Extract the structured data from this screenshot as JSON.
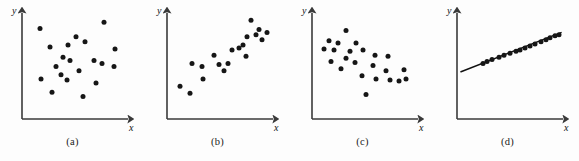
{
  "figure": {
    "background_color": "#fdfdfd",
    "point_color": "#161616",
    "axis_color": "#3a3a3a",
    "line_color": "#111111",
    "width": 579,
    "height": 161
  },
  "axis": {
    "x_label": "x",
    "y_label": "y"
  },
  "panels": [
    {
      "id": "a",
      "caption": "(a)",
      "description": "no correlation",
      "chart_data": {
        "type": "scatter",
        "title": "(a)",
        "xlabel": "x",
        "ylabel": "y",
        "xlim": [
          0,
          100
        ],
        "ylim": [
          0,
          100
        ],
        "grid": false,
        "legend": "none",
        "has_fit_line": false,
        "correlation": "none",
        "points": [
          [
            14,
            84
          ],
          [
            78,
            90
          ],
          [
            50,
            76
          ],
          [
            24,
            66
          ],
          [
            42,
            68
          ],
          [
            59,
            71
          ],
          [
            89,
            64
          ],
          [
            37,
            56
          ],
          [
            68,
            53
          ],
          [
            76,
            50
          ],
          [
            44,
            53
          ],
          [
            30,
            47
          ],
          [
            88,
            47
          ],
          [
            53,
            43
          ],
          [
            15,
            35
          ],
          [
            41,
            34
          ],
          [
            70,
            31
          ],
          [
            35,
            39
          ],
          [
            26,
            22
          ],
          [
            57,
            18
          ]
        ]
      }
    },
    {
      "id": "b",
      "caption": "(b)",
      "description": "positive correlation",
      "chart_data": {
        "type": "scatter",
        "title": "(b)",
        "xlabel": "x",
        "ylabel": "y",
        "xlim": [
          0,
          100
        ],
        "ylim": [
          0,
          100
        ],
        "grid": false,
        "legend": "none",
        "has_fit_line": false,
        "correlation": "positive",
        "points": [
          [
            9,
            28
          ],
          [
            19,
            21
          ],
          [
            21,
            50
          ],
          [
            31,
            47
          ],
          [
            32,
            35
          ],
          [
            43,
            58
          ],
          [
            48,
            49
          ],
          [
            53,
            43
          ],
          [
            57,
            50
          ],
          [
            61,
            63
          ],
          [
            68,
            65
          ],
          [
            72,
            68
          ],
          [
            75,
            57
          ],
          [
            76,
            76
          ],
          [
            80,
            92
          ],
          [
            85,
            78
          ],
          [
            88,
            83
          ],
          [
            91,
            73
          ],
          [
            96,
            80
          ]
        ]
      }
    },
    {
      "id": "c",
      "caption": "(c)",
      "description": "negative correlation",
      "chart_data": {
        "type": "scatter",
        "title": "(c)",
        "xlabel": "x",
        "ylabel": "y",
        "xlim": [
          0,
          100
        ],
        "ylim": [
          0,
          100
        ],
        "grid": false,
        "legend": "none",
        "has_fit_line": false,
        "correlation": "negative",
        "points": [
          [
            30,
            82
          ],
          [
            13,
            72
          ],
          [
            22,
            70
          ],
          [
            40,
            70
          ],
          [
            8,
            64
          ],
          [
            18,
            63
          ],
          [
            34,
            62
          ],
          [
            47,
            63
          ],
          [
            30,
            55
          ],
          [
            59,
            58
          ],
          [
            15,
            52
          ],
          [
            72,
            57
          ],
          [
            39,
            51
          ],
          [
            57,
            48
          ],
          [
            25,
            45
          ],
          [
            70,
            43
          ],
          [
            88,
            44
          ],
          [
            46,
            38
          ],
          [
            60,
            35
          ],
          [
            74,
            34
          ],
          [
            83,
            33
          ],
          [
            90,
            35
          ],
          [
            50,
            20
          ]
        ]
      }
    },
    {
      "id": "d",
      "caption": "(d)",
      "description": "perfect linear relationship with fitted line",
      "chart_data": {
        "type": "scatter",
        "title": "(d)",
        "xlabel": "x",
        "ylabel": "y",
        "xlim": [
          0,
          100
        ],
        "ylim": [
          0,
          100
        ],
        "grid": false,
        "legend": "none",
        "has_fit_line": true,
        "correlation": "strong positive",
        "fit_line": {
          "x_start": 0,
          "y_start": 42,
          "x_end": 100,
          "y_end": 80
        },
        "points": [
          [
            22,
            50
          ],
          [
            26,
            52
          ],
          [
            31,
            54
          ],
          [
            38,
            56
          ],
          [
            43,
            58
          ],
          [
            49,
            60
          ],
          [
            55,
            62
          ],
          [
            59,
            63
          ],
          [
            64,
            65
          ],
          [
            69,
            67
          ],
          [
            74,
            69
          ],
          [
            80,
            71
          ],
          [
            85,
            73
          ],
          [
            89,
            75
          ],
          [
            94,
            77
          ],
          [
            98,
            78
          ]
        ]
      }
    }
  ]
}
